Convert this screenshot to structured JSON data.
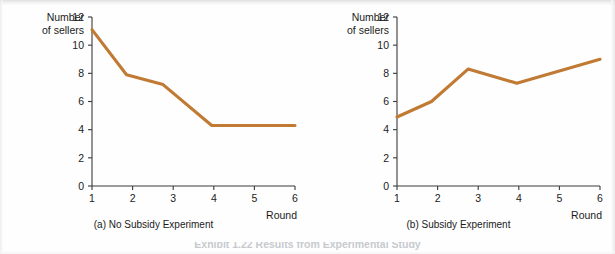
{
  "figure": {
    "background_color": "#fefefe",
    "line_color": "#c07a33",
    "axis_color": "#3a3a3a",
    "text_color": "#1b1b1b",
    "bottom_caption": "Exhibit 1.22 Results from Experimental Study"
  },
  "chart_data": [
    {
      "type": "line",
      "panel_id": "a",
      "title": "(a) No Subsidy Experiment",
      "xlabel": "Round",
      "ylabel": "Number of sellers",
      "ylabel_line1": "Number",
      "ylabel_line2": "of sellers",
      "xlim": [
        1,
        6
      ],
      "ylim": [
        0,
        12
      ],
      "xticks": [
        1,
        2,
        3,
        4,
        5,
        6
      ],
      "yticks": [
        0,
        2,
        4,
        6,
        8,
        10,
        12
      ],
      "xtick_labels": [
        "1",
        "2",
        "3",
        "4",
        "5",
        "6"
      ],
      "ytick_labels": [
        "0",
        "2",
        "4",
        "6",
        "8",
        "10",
        "12"
      ],
      "grid": false,
      "legend": "none",
      "series": [
        {
          "name": "No Subsidy",
          "color": "#c07a33",
          "x": [
            1.0,
            1.85,
            2.75,
            3.95,
            6.0
          ],
          "values": [
            11.1,
            7.9,
            7.2,
            4.3,
            4.3
          ]
        }
      ]
    },
    {
      "type": "line",
      "panel_id": "b",
      "title": "(b) Subsidy Experiment",
      "xlabel": "Round",
      "ylabel": "Number of sellers",
      "ylabel_line1": "Number",
      "ylabel_line2": "of sellers",
      "xlim": [
        1,
        6
      ],
      "ylim": [
        0,
        12
      ],
      "xticks": [
        1,
        2,
        3,
        4,
        5,
        6
      ],
      "yticks": [
        0,
        2,
        4,
        6,
        8,
        10,
        12
      ],
      "xtick_labels": [
        "1",
        "2",
        "3",
        "4",
        "5",
        "6"
      ],
      "ytick_labels": [
        "0",
        "2",
        "4",
        "6",
        "8",
        "10",
        "12"
      ],
      "grid": false,
      "legend": "none",
      "series": [
        {
          "name": "Subsidy",
          "color": "#c07a33",
          "x": [
            1.0,
            1.85,
            2.75,
            3.95,
            6.0
          ],
          "values": [
            4.9,
            6.0,
            8.3,
            7.3,
            9.0
          ]
        }
      ]
    }
  ]
}
